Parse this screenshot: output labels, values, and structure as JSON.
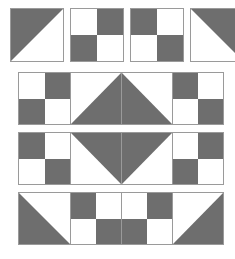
{
  "figure": {
    "width": 235,
    "height": 259,
    "background_color": "#ffffff",
    "patch_dark_color": "#6e6e6e",
    "patch_light_color": "#ffffff",
    "outline_color": "#9a9a9a"
  },
  "rows": [
    {
      "name": "row-1-detached-squares",
      "layout": "detached",
      "left": 10,
      "top": 8,
      "cell_size": 54,
      "gap": 6,
      "cells": [
        {
          "name": "half-square-triangle",
          "type": "triangle",
          "dark_corner": "top-left"
        },
        {
          "name": "four-patch",
          "type": "four-patch",
          "quadrants": [
            "light",
            "dark",
            "dark",
            "light"
          ]
        },
        {
          "name": "four-patch",
          "type": "four-patch",
          "quadrants": [
            "dark",
            "light",
            "light",
            "dark"
          ]
        },
        {
          "name": "half-square-triangle",
          "type": "triangle",
          "dark_corner": "top-right"
        }
      ]
    },
    {
      "name": "row-2-joined-strip",
      "layout": "strip",
      "left": 18,
      "top": 72,
      "cell_size": 51,
      "cells": [
        {
          "name": "four-patch",
          "type": "four-patch",
          "quadrants": [
            "light",
            "dark",
            "dark",
            "light"
          ]
        },
        {
          "name": "half-square-triangle",
          "type": "triangle",
          "dark_corner": "bottom-right"
        },
        {
          "name": "half-square-triangle",
          "type": "triangle",
          "dark_corner": "bottom-left"
        },
        {
          "name": "four-patch",
          "type": "four-patch",
          "quadrants": [
            "dark",
            "light",
            "light",
            "dark"
          ]
        }
      ]
    },
    {
      "name": "row-3-joined-strip",
      "layout": "strip",
      "left": 18,
      "top": 132,
      "cell_size": 51,
      "cells": [
        {
          "name": "four-patch",
          "type": "four-patch",
          "quadrants": [
            "dark",
            "light",
            "light",
            "dark"
          ]
        },
        {
          "name": "half-square-triangle",
          "type": "triangle",
          "dark_corner": "top-right"
        },
        {
          "name": "half-square-triangle",
          "type": "triangle",
          "dark_corner": "top-left"
        },
        {
          "name": "four-patch",
          "type": "four-patch",
          "quadrants": [
            "light",
            "dark",
            "dark",
            "light"
          ]
        }
      ]
    },
    {
      "name": "row-4-joined-strip",
      "layout": "strip",
      "left": 18,
      "top": 192,
      "cell_size": 51,
      "cells": [
        {
          "name": "half-square-triangle",
          "type": "triangle",
          "dark_corner": "bottom-left"
        },
        {
          "name": "four-patch",
          "type": "four-patch",
          "quadrants": [
            "dark",
            "light",
            "light",
            "dark"
          ]
        },
        {
          "name": "four-patch",
          "type": "four-patch",
          "quadrants": [
            "light",
            "dark",
            "dark",
            "light"
          ]
        },
        {
          "name": "half-square-triangle",
          "type": "triangle",
          "dark_corner": "bottom-right"
        }
      ]
    }
  ]
}
